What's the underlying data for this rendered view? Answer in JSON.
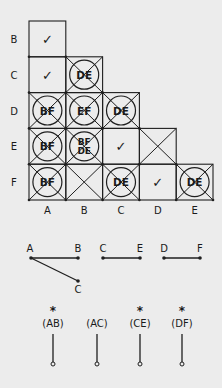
{
  "implication_table": {
    "row_labels": [
      "B",
      "C",
      "D",
      "E",
      "F"
    ],
    "col_labels": [
      "A",
      "B",
      "C",
      "D",
      "E"
    ],
    "cells": [
      {
        "row": "B",
        "col": "A",
        "mark": "check",
        "text": []
      },
      {
        "row": "C",
        "col": "A",
        "mark": "check",
        "text": []
      },
      {
        "row": "C",
        "col": "B",
        "mark": "crossed",
        "text": [
          "DE"
        ]
      },
      {
        "row": "D",
        "col": "A",
        "mark": "crossed",
        "text": [
          "BF"
        ]
      },
      {
        "row": "D",
        "col": "B",
        "mark": "crossed",
        "text": [
          "EF"
        ]
      },
      {
        "row": "D",
        "col": "C",
        "mark": "crossed",
        "text": [
          "DE"
        ]
      },
      {
        "row": "E",
        "col": "A",
        "mark": "crossed",
        "text": [
          "BF"
        ]
      },
      {
        "row": "E",
        "col": "B",
        "mark": "crossed",
        "text": [
          "BF",
          "DE"
        ]
      },
      {
        "row": "E",
        "col": "C",
        "mark": "check",
        "text": []
      },
      {
        "row": "E",
        "col": "D",
        "mark": "x",
        "text": []
      },
      {
        "row": "F",
        "col": "A",
        "mark": "crossed",
        "text": [
          "BF"
        ]
      },
      {
        "row": "F",
        "col": "B",
        "mark": "x",
        "text": []
      },
      {
        "row": "F",
        "col": "C",
        "mark": "crossed",
        "text": [
          "DE"
        ]
      },
      {
        "row": "F",
        "col": "D",
        "mark": "check",
        "text": []
      },
      {
        "row": "F",
        "col": "E",
        "mark": "crossed",
        "text": [
          "DE"
        ]
      }
    ],
    "check_glyph": "✓"
  },
  "compatibility_graph": {
    "nodes": [
      {
        "id": "A1",
        "label": "A",
        "x": 31,
        "y": 258,
        "lx": 30,
        "ly": 252
      },
      {
        "id": "B1",
        "label": "B",
        "x": 78,
        "y": 258,
        "lx": 78,
        "ly": 252
      },
      {
        "id": "C1",
        "label": "C",
        "x": 78,
        "y": 281,
        "lx": 78,
        "ly": 293
      },
      {
        "id": "C2",
        "label": "C",
        "x": 103,
        "y": 258,
        "lx": 103,
        "ly": 252
      },
      {
        "id": "E2",
        "label": "E",
        "x": 140,
        "y": 258,
        "lx": 140,
        "ly": 252
      },
      {
        "id": "D3",
        "label": "D",
        "x": 164,
        "y": 258,
        "lx": 164,
        "ly": 252
      },
      {
        "id": "F3",
        "label": "F",
        "x": 200,
        "y": 258,
        "lx": 200,
        "ly": 252
      }
    ],
    "edges": [
      [
        "A1",
        "B1"
      ],
      [
        "A1",
        "C1"
      ],
      [
        "C2",
        "E2"
      ],
      [
        "D3",
        "F3"
      ]
    ]
  },
  "closure_classes": [
    {
      "label": "(AB)",
      "starred": true,
      "x": 53
    },
    {
      "label": "(AC)",
      "starred": false,
      "x": 97
    },
    {
      "label": "(CE)",
      "starred": true,
      "x": 140
    },
    {
      "label": "(DF)",
      "starred": true,
      "x": 182
    }
  ],
  "star_glyph": "*"
}
